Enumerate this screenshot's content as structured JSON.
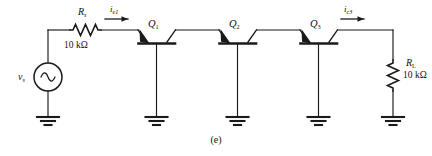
{
  "figure": {
    "caption": "(e)",
    "type": "BJT cascade circuit schematic"
  },
  "source": {
    "name": "v",
    "subscript": "s",
    "symbol": "ac-sine"
  },
  "resistors": [
    {
      "name": "R",
      "subscript": "s",
      "value": "10 kΩ",
      "orientation": "horizontal"
    },
    {
      "name": "R",
      "subscript": "L",
      "value": "10 kΩ",
      "orientation": "vertical"
    }
  ],
  "transistors": [
    {
      "label": "Q",
      "subscript": "1"
    },
    {
      "label": "Q",
      "subscript": "2"
    },
    {
      "label": "Q",
      "subscript": "3"
    }
  ],
  "currents": [
    {
      "name": "i",
      "subscript": "e1",
      "direction": "right"
    },
    {
      "name": "i",
      "subscript": "c3",
      "direction": "right"
    }
  ],
  "grounds": {
    "count": 5,
    "symbol": "ground-3bar"
  },
  "colors": {
    "line": "#1a1a1a",
    "background": "#ffffff",
    "text": "#111111"
  }
}
